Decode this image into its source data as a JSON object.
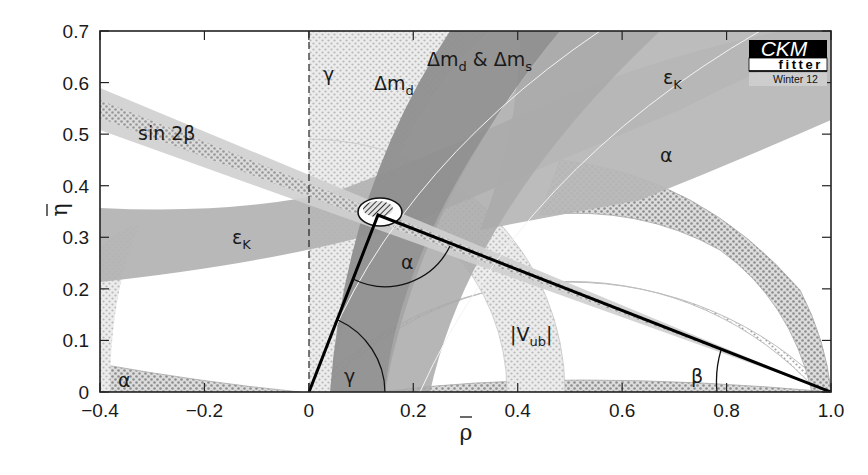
{
  "chart_data": {
    "type": "scatter",
    "title": "",
    "xlabel": "ρ̄",
    "ylabel": "η̄",
    "xlim": [
      -0.4,
      1.0
    ],
    "ylim": [
      0,
      0.7
    ],
    "xticks": [
      "-0.4",
      "-0.2",
      "0",
      "0.2",
      "0.4",
      "0.6",
      "0.8",
      "1.0"
    ],
    "yticks": [
      "0",
      "0.1",
      "0.2",
      "0.3",
      "0.4",
      "0.5",
      "0.6",
      "0.7"
    ],
    "grid": false,
    "logo": {
      "main": "CKM",
      "sub": "fitter",
      "season": "Winter 12"
    },
    "unitarity_triangle": {
      "vertices": [
        [
          0,
          0
        ],
        [
          1,
          0
        ],
        [
          0.132,
          0.343
        ]
      ],
      "angle_labels": [
        {
          "name": "alpha",
          "text": "α",
          "rho": 0.18,
          "eta": 0.24
        },
        {
          "name": "beta",
          "text": "β",
          "rho": 0.78,
          "eta": 0.07
        },
        {
          "name": "gamma",
          "text": "γ",
          "rho": 0.075,
          "eta": 0.04
        }
      ]
    },
    "best_fit_region": {
      "rho_center": 0.14,
      "eta_center": 0.345,
      "rho_halfwidth": 0.04,
      "eta_halfwidth": 0.025
    },
    "constraints": [
      {
        "name": "sin 2β",
        "label": "sin 2β",
        "label_pos": [
          -0.33,
          0.49
        ],
        "style": "light-grey-dotted-band",
        "description": "straight band from (1,0) through apex, slope ≈ -0.34"
      },
      {
        "name": "εK",
        "label": "εK",
        "label_pos": [
          -0.25,
          0.3
        ],
        "style": "medium-grey-hyperbola",
        "description": "hyperbolic band; η≈0.21–0.36 at ρ=-0.4 rising to top-right"
      },
      {
        "name": "εK (upper)",
        "label": "εK",
        "label_pos": [
          0.64,
          0.61
        ],
        "style": "medium-grey-hyperbola"
      },
      {
        "name": "Δmd",
        "label": "Δmd",
        "label_pos": [
          0.08,
          0.6
        ],
        "style": "dark-grey-ring",
        "description": "annulus centred at (1,0), R ≈ 0.82–0.96"
      },
      {
        "name": "Δmd & Δms",
        "label": "Δmd & Δms",
        "label_pos": [
          0.18,
          0.63
        ],
        "style": "dark-grey-ring",
        "description": "annulus centred at (1,0), R ≈ 0.84–0.90"
      },
      {
        "name": "γ",
        "label": "γ",
        "label_pos": [
          0.02,
          0.62
        ],
        "style": "light-dotted-wedge",
        "description": "γ wedge between the dashed line ρ=0 and slope ≈ 0.35 line"
      },
      {
        "name": "α",
        "label": "α",
        "label_pos": [
          0.71,
          0.47
        ],
        "style": "dotted-arc",
        "description": "circle arc through (0,0) and (1,0)"
      },
      {
        "name": "α (left)",
        "label": "α",
        "label_pos": [
          -0.36,
          0.01
        ],
        "style": "dotted-arc"
      },
      {
        "name": "|Vub|",
        "label": "|Vub|",
        "label_pos": [
          0.41,
          0.11
        ],
        "style": "dotted-ring",
        "description": "annulus centred at (0,0), R ≈ 0.38–0.49"
      }
    ]
  }
}
